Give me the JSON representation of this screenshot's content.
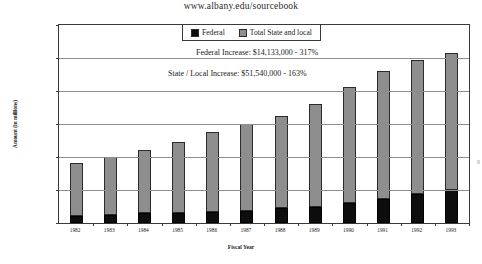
{
  "page": {
    "title": "www.albany.edu/sourcebook"
  },
  "chart_data": {
    "type": "bar",
    "subtype": "stacked",
    "title": "www.albany.edu/sourcebook",
    "xlabel": "Fiscal Year",
    "ylabel": "Amount (in millions)",
    "ylim": [
      0,
      120000
    ],
    "ytick_values": [
      0,
      20000,
      40000,
      60000,
      80000,
      100000,
      120000
    ],
    "ytick_labels": [
      "$0",
      "$20,000",
      "$40,000",
      "$60,000",
      "$80,000",
      "$100,000",
      "$120,000"
    ],
    "grid": true,
    "legend_position": "top-center",
    "categories": [
      "1982",
      "1983",
      "1984",
      "1985",
      "1986",
      "1987",
      "1988",
      "1989",
      "1990",
      "1991",
      "1992",
      "1993"
    ],
    "series": [
      {
        "name": "Federal",
        "color": "#0d0d0d",
        "values": [
          4500,
          5000,
          5800,
          6200,
          6500,
          7500,
          9000,
          9800,
          12000,
          14800,
          17500,
          20000
        ]
      },
      {
        "name": "Total State and local",
        "color": "#8e8e8e",
        "values": [
          32000,
          35000,
          38700,
          42800,
          48500,
          52500,
          56000,
          62200,
          70500,
          77200,
          81500,
          83000
        ]
      }
    ],
    "totals": [
      36500,
      40000,
      44500,
      49000,
      55000,
      60000,
      65000,
      72000,
      82500,
      92000,
      99000,
      103000
    ],
    "annotations": [
      "Federal Increase:  $14,133,000 -  317%",
      "State / Local Increase:  $51,540,000 - 163%"
    ]
  },
  "legend": {
    "items": [
      {
        "label": "Federal",
        "swatch": "federal"
      },
      {
        "label": "Total State and local",
        "swatch": "state"
      }
    ]
  }
}
